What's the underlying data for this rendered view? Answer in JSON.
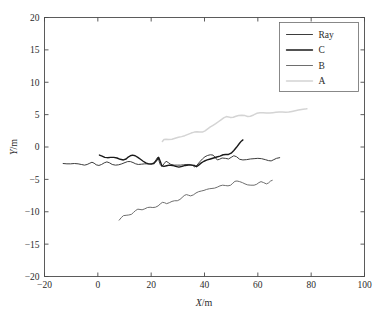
{
  "figure": {
    "background": "#ffffff",
    "width": 389,
    "height": 322
  },
  "chart_data": {
    "type": "line",
    "title": "",
    "xlabel": "X/m",
    "ylabel": "Y/m",
    "xlim": [
      -20,
      100
    ],
    "ylim": [
      -20,
      20
    ],
    "xticks": [
      -20,
      0,
      20,
      40,
      60,
      80,
      100
    ],
    "xtick_labels": [
      "−20",
      "0",
      "20",
      "40",
      "60",
      "80",
      "100"
    ],
    "yticks": [
      -20,
      -15,
      -10,
      -5,
      0,
      5,
      10,
      15,
      20
    ],
    "ytick_labels": [
      "−20",
      "−15",
      "−10",
      "−5",
      "0",
      "5",
      "10",
      "15",
      "20"
    ],
    "grid": false,
    "legend_position": "upper right",
    "legend_entries": [
      "Ray",
      "C",
      "B",
      "A"
    ],
    "series": [
      {
        "name": "Ray",
        "color": "#3d3d3d",
        "linewidth": 1.0,
        "points": [
          [
            -13.0,
            -2.55
          ],
          [
            -11.6,
            -2.6
          ],
          [
            -10.2,
            -2.6
          ],
          [
            -8.8,
            -2.55
          ],
          [
            -7.4,
            -2.6
          ],
          [
            -6.2,
            -2.7
          ],
          [
            -5.0,
            -2.8
          ],
          [
            -4.0,
            -2.7
          ],
          [
            -3.0,
            -2.5
          ],
          [
            -2.2,
            -2.35
          ],
          [
            -1.4,
            -2.5
          ],
          [
            -0.6,
            -2.75
          ],
          [
            0.4,
            -2.85
          ],
          [
            1.4,
            -2.7
          ],
          [
            2.4,
            -2.45
          ],
          [
            3.4,
            -2.3
          ],
          [
            4.4,
            -2.45
          ],
          [
            5.4,
            -2.7
          ],
          [
            6.6,
            -2.8
          ],
          [
            7.8,
            -2.75
          ],
          [
            9.0,
            -2.6
          ],
          [
            10.2,
            -2.4
          ],
          [
            11.2,
            -2.25
          ],
          [
            12.2,
            -2.25
          ],
          [
            13.2,
            -2.4
          ],
          [
            14.2,
            -2.6
          ],
          [
            15.2,
            -2.7
          ],
          [
            16.4,
            -2.65
          ],
          [
            17.6,
            -2.6
          ],
          [
            18.8,
            -2.6
          ],
          [
            20.0,
            -2.6
          ],
          [
            21.0,
            -2.45
          ],
          [
            21.8,
            -2.0
          ],
          [
            22.4,
            -1.6
          ],
          [
            22.9,
            -2.1
          ],
          [
            23.4,
            -2.7
          ],
          [
            24.0,
            -3.0
          ],
          [
            24.8,
            -2.6
          ],
          [
            25.6,
            -2.2
          ],
          [
            26.4,
            -2.4
          ],
          [
            27.4,
            -2.7
          ],
          [
            28.6,
            -2.8
          ],
          [
            29.8,
            -2.8
          ],
          [
            31.0,
            -2.8
          ],
          [
            32.2,
            -2.75
          ],
          [
            33.4,
            -2.7
          ],
          [
            34.6,
            -2.7
          ],
          [
            35.6,
            -2.85
          ],
          [
            36.4,
            -3.1
          ],
          [
            37.2,
            -2.8
          ],
          [
            38.2,
            -2.3
          ],
          [
            39.2,
            -1.85
          ],
          [
            40.2,
            -1.5
          ],
          [
            41.2,
            -1.3
          ],
          [
            42.2,
            -1.2
          ],
          [
            43.2,
            -1.25
          ],
          [
            44.0,
            -1.6
          ],
          [
            44.8,
            -2.0
          ],
          [
            45.6,
            -1.9
          ],
          [
            46.6,
            -1.7
          ],
          [
            47.8,
            -1.75
          ],
          [
            49.0,
            -1.85
          ],
          [
            50.0,
            -1.6
          ],
          [
            51.0,
            -1.35
          ],
          [
            52.0,
            -1.5
          ],
          [
            53.2,
            -1.9
          ],
          [
            54.4,
            -2.0
          ],
          [
            55.8,
            -1.95
          ],
          [
            57.2,
            -1.85
          ],
          [
            58.6,
            -1.8
          ],
          [
            60.0,
            -1.75
          ],
          [
            61.4,
            -1.8
          ],
          [
            62.8,
            -1.95
          ],
          [
            64.0,
            -2.1
          ],
          [
            65.0,
            -2.15
          ],
          [
            66.0,
            -1.95
          ],
          [
            67.0,
            -1.75
          ],
          [
            68.2,
            -1.65
          ]
        ]
      },
      {
        "name": "C",
        "color": "#1a1a1a",
        "linewidth": 1.4,
        "points": [
          [
            0.6,
            -1.25
          ],
          [
            1.6,
            -1.4
          ],
          [
            2.6,
            -1.6
          ],
          [
            3.6,
            -1.65
          ],
          [
            4.8,
            -1.6
          ],
          [
            6.0,
            -1.6
          ],
          [
            7.2,
            -1.7
          ],
          [
            8.4,
            -1.9
          ],
          [
            9.6,
            -2.0
          ],
          [
            10.6,
            -1.85
          ],
          [
            11.4,
            -1.55
          ],
          [
            12.2,
            -1.35
          ],
          [
            13.0,
            -1.25
          ],
          [
            14.0,
            -1.35
          ],
          [
            15.0,
            -1.6
          ],
          [
            16.0,
            -1.9
          ],
          [
            17.0,
            -2.2
          ],
          [
            18.0,
            -2.45
          ],
          [
            19.0,
            -2.6
          ],
          [
            20.0,
            -2.65
          ],
          [
            21.0,
            -2.55
          ],
          [
            22.0,
            -2.1
          ],
          [
            22.8,
            -1.6
          ],
          [
            23.4,
            -2.2
          ],
          [
            24.0,
            -2.9
          ],
          [
            24.8,
            -3.0
          ],
          [
            25.8,
            -2.9
          ],
          [
            26.8,
            -2.8
          ],
          [
            28.0,
            -2.85
          ],
          [
            29.2,
            -3.0
          ],
          [
            30.4,
            -3.1
          ],
          [
            31.6,
            -3.0
          ],
          [
            32.8,
            -2.85
          ],
          [
            34.0,
            -2.8
          ],
          [
            35.2,
            -2.8
          ],
          [
            36.2,
            -2.85
          ],
          [
            37.0,
            -3.05
          ],
          [
            37.8,
            -2.8
          ],
          [
            38.8,
            -2.45
          ],
          [
            39.8,
            -2.2
          ],
          [
            41.0,
            -2.0
          ],
          [
            42.2,
            -1.85
          ],
          [
            43.4,
            -1.7
          ],
          [
            44.6,
            -1.55
          ],
          [
            45.8,
            -1.4
          ],
          [
            47.0,
            -1.2
          ],
          [
            48.0,
            -1.15
          ],
          [
            49.0,
            -1.15
          ],
          [
            50.0,
            -0.95
          ],
          [
            51.0,
            -0.55
          ],
          [
            52.0,
            -0.05
          ],
          [
            53.0,
            0.5
          ],
          [
            53.8,
            0.9
          ],
          [
            54.4,
            1.1
          ]
        ]
      },
      {
        "name": "B",
        "color": "#6e6e6e",
        "linewidth": 1.0,
        "points": [
          [
            8.0,
            -11.3
          ],
          [
            8.8,
            -10.9
          ],
          [
            9.6,
            -10.6
          ],
          [
            10.6,
            -10.55
          ],
          [
            11.6,
            -10.5
          ],
          [
            12.6,
            -10.4
          ],
          [
            13.4,
            -10.1
          ],
          [
            14.2,
            -9.8
          ],
          [
            15.0,
            -9.6
          ],
          [
            15.8,
            -9.65
          ],
          [
            16.6,
            -9.7
          ],
          [
            17.6,
            -9.55
          ],
          [
            18.6,
            -9.35
          ],
          [
            19.6,
            -9.3
          ],
          [
            20.6,
            -9.35
          ],
          [
            21.6,
            -9.3
          ],
          [
            22.6,
            -9.1
          ],
          [
            23.4,
            -8.8
          ],
          [
            24.2,
            -8.55
          ],
          [
            25.0,
            -8.6
          ],
          [
            25.8,
            -8.75
          ],
          [
            26.8,
            -8.6
          ],
          [
            27.8,
            -8.4
          ],
          [
            28.8,
            -8.3
          ],
          [
            29.8,
            -8.3
          ],
          [
            30.8,
            -8.1
          ],
          [
            31.6,
            -7.8
          ],
          [
            32.4,
            -7.5
          ],
          [
            33.2,
            -7.35
          ],
          [
            34.0,
            -7.45
          ],
          [
            34.8,
            -7.55
          ],
          [
            35.8,
            -7.4
          ],
          [
            36.8,
            -7.1
          ],
          [
            37.8,
            -6.9
          ],
          [
            38.8,
            -6.8
          ],
          [
            39.8,
            -6.7
          ],
          [
            40.8,
            -6.55
          ],
          [
            41.8,
            -6.45
          ],
          [
            42.8,
            -6.4
          ],
          [
            43.8,
            -6.35
          ],
          [
            44.8,
            -6.2
          ],
          [
            45.8,
            -6.0
          ],
          [
            46.8,
            -5.9
          ],
          [
            47.8,
            -5.95
          ],
          [
            48.8,
            -6.0
          ],
          [
            49.8,
            -5.9
          ],
          [
            50.6,
            -5.6
          ],
          [
            51.4,
            -5.3
          ],
          [
            52.2,
            -5.25
          ],
          [
            53.2,
            -5.35
          ],
          [
            54.2,
            -5.5
          ],
          [
            55.2,
            -5.7
          ],
          [
            56.2,
            -5.85
          ],
          [
            57.4,
            -5.9
          ],
          [
            58.6,
            -5.9
          ],
          [
            59.6,
            -5.75
          ],
          [
            60.4,
            -5.5
          ],
          [
            61.2,
            -5.35
          ],
          [
            62.2,
            -5.5
          ],
          [
            63.2,
            -5.7
          ],
          [
            64.0,
            -5.55
          ],
          [
            64.8,
            -5.25
          ],
          [
            65.4,
            -5.15
          ]
        ]
      },
      {
        "name": "A",
        "color": "#d4d4d4",
        "linewidth": 1.5,
        "points": [
          [
            24.2,
            0.85
          ],
          [
            24.8,
            1.15
          ],
          [
            25.6,
            1.2
          ],
          [
            26.6,
            1.15
          ],
          [
            27.8,
            1.2
          ],
          [
            29.0,
            1.35
          ],
          [
            30.2,
            1.5
          ],
          [
            31.4,
            1.6
          ],
          [
            32.6,
            1.75
          ],
          [
            33.8,
            1.95
          ],
          [
            35.0,
            2.15
          ],
          [
            36.2,
            2.3
          ],
          [
            37.2,
            2.35
          ],
          [
            38.2,
            2.3
          ],
          [
            39.2,
            2.3
          ],
          [
            40.2,
            2.5
          ],
          [
            41.2,
            2.8
          ],
          [
            42.2,
            3.1
          ],
          [
            43.2,
            3.35
          ],
          [
            44.2,
            3.6
          ],
          [
            45.2,
            3.9
          ],
          [
            46.2,
            4.2
          ],
          [
            47.2,
            4.5
          ],
          [
            48.2,
            4.7
          ],
          [
            49.0,
            4.65
          ],
          [
            49.8,
            4.55
          ],
          [
            50.8,
            4.6
          ],
          [
            51.8,
            4.75
          ],
          [
            52.8,
            4.85
          ],
          [
            54.0,
            4.9
          ],
          [
            55.2,
            4.85
          ],
          [
            56.2,
            4.7
          ],
          [
            57.2,
            4.75
          ],
          [
            58.4,
            4.95
          ],
          [
            59.6,
            5.2
          ],
          [
            60.8,
            5.3
          ],
          [
            62.0,
            5.3
          ],
          [
            63.2,
            5.25
          ],
          [
            64.4,
            5.25
          ],
          [
            65.6,
            5.3
          ],
          [
            66.8,
            5.35
          ],
          [
            68.0,
            5.4
          ],
          [
            69.2,
            5.4
          ],
          [
            70.4,
            5.35
          ],
          [
            71.6,
            5.4
          ],
          [
            72.8,
            5.5
          ],
          [
            74.0,
            5.6
          ],
          [
            75.2,
            5.7
          ],
          [
            76.4,
            5.8
          ],
          [
            77.6,
            5.85
          ],
          [
            78.4,
            5.9
          ]
        ]
      }
    ]
  }
}
